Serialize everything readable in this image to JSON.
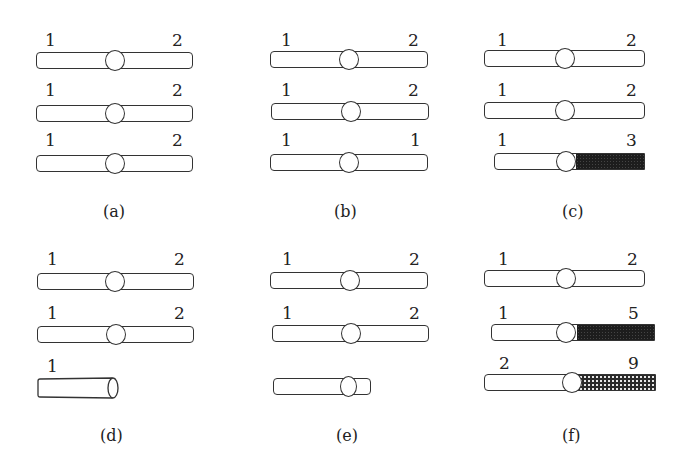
{
  "figure": {
    "panels": [
      {
        "id": "a",
        "caption": "(a)",
        "chromosomes": [
          {
            "left_label": "1",
            "right_label": "2",
            "type": "normal"
          },
          {
            "left_label": "1",
            "right_label": "2",
            "type": "normal"
          },
          {
            "left_label": "1",
            "right_label": "2",
            "type": "normal"
          }
        ]
      },
      {
        "id": "b",
        "caption": "(b)",
        "chromosomes": [
          {
            "left_label": "1",
            "right_label": "2",
            "type": "normal"
          },
          {
            "left_label": "1",
            "right_label": "2",
            "type": "normal"
          },
          {
            "left_label": "1",
            "right_label": "1",
            "type": "normal"
          }
        ]
      },
      {
        "id": "c",
        "caption": "(c)",
        "chromosomes": [
          {
            "left_label": "1",
            "right_label": "2",
            "type": "normal"
          },
          {
            "left_label": "1",
            "right_label": "2",
            "type": "normal"
          },
          {
            "left_label": "1",
            "right_label": "3",
            "type": "translocation-dark"
          }
        ]
      },
      {
        "id": "d",
        "caption": "(d)",
        "chromosomes": [
          {
            "left_label": "1",
            "right_label": "2",
            "type": "normal"
          },
          {
            "left_label": "1",
            "right_label": "2",
            "type": "normal"
          },
          {
            "left_label": "1",
            "right_label": "",
            "type": "broken-fragment"
          }
        ]
      },
      {
        "id": "e",
        "caption": "(e)",
        "chromosomes": [
          {
            "left_label": "1",
            "right_label": "2",
            "type": "normal"
          },
          {
            "left_label": "1",
            "right_label": "2",
            "type": "normal"
          },
          {
            "left_label": "",
            "right_label": "",
            "type": "deletion-short"
          }
        ]
      },
      {
        "id": "f",
        "caption": "(f)",
        "chromosomes": [
          {
            "left_label": "1",
            "right_label": "2",
            "type": "normal"
          },
          {
            "left_label": "1",
            "right_label": "5",
            "type": "translocation-dark"
          },
          {
            "left_label": "2",
            "right_label": "9",
            "type": "translocation-checkered"
          }
        ]
      }
    ]
  }
}
